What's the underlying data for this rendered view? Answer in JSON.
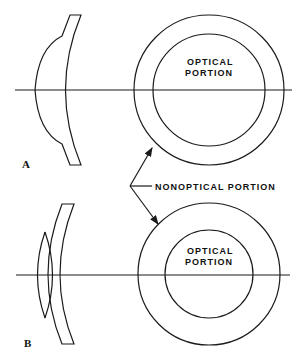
{
  "figure": {
    "panel_a": {
      "label": "A",
      "optical_label_line1": "OPTICAL",
      "optical_label_line2": "PORTION"
    },
    "panel_b": {
      "label": "B",
      "optical_label_line1": "OPTICAL",
      "optical_label_line2": "PORTION"
    },
    "shared_callout": "NONOPTICAL PORTION"
  }
}
